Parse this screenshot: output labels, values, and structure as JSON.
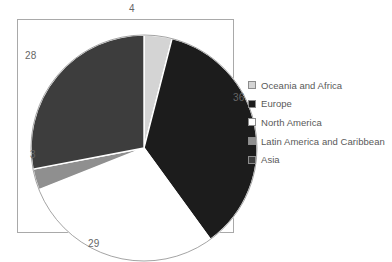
{
  "chart_data": {
    "type": "pie",
    "title": "",
    "subtitle": "",
    "xlabel": "",
    "ylabel": "",
    "grid": false,
    "legend_position": "right",
    "start_angle_deg": 0,
    "direction": "clockwise",
    "categories": [
      "Oceania and Africa",
      "Europe",
      "North America",
      "Latin America and Caribbean",
      "Asia"
    ],
    "values": [
      4,
      36,
      29,
      3,
      28
    ],
    "value_labels": [
      "4",
      "36",
      "29",
      "3",
      "28"
    ],
    "colors": [
      "#d4d4d4",
      "#1c1c1c",
      "#ffffff",
      "#8f8f8f",
      "#3d3d3d"
    ],
    "slices": [
      {
        "label": "Oceania and Africa",
        "value": 4,
        "value_label": "4",
        "color": "#d4d4d4",
        "start_deg": 0,
        "end_deg": 14.4
      },
      {
        "label": "Europe",
        "value": 36,
        "value_label": "36",
        "color": "#1c1c1c",
        "start_deg": 14.4,
        "end_deg": 144.0
      },
      {
        "label": "North America",
        "value": 29,
        "value_label": "29",
        "color": "#ffffff",
        "start_deg": 144.0,
        "end_deg": 248.4
      },
      {
        "label": "Latin America and Caribbean",
        "value": 3,
        "value_label": "3",
        "color": "#8f8f8f",
        "start_deg": 248.4,
        "end_deg": 259.2
      },
      {
        "label": "Asia",
        "value": 28,
        "value_label": "28",
        "color": "#3d3d3d",
        "start_deg": 259.2,
        "end_deg": 360.0
      }
    ]
  },
  "legend": {
    "items": [
      {
        "label": "Oceania and Africa",
        "color": "#d4d4d4"
      },
      {
        "label": "Europe",
        "color": "#1c1c1c"
      },
      {
        "label": "North America",
        "color": "#ffffff"
      },
      {
        "label": "Latin America and Caribbean",
        "color": "#8f8f8f"
      },
      {
        "label": "Asia",
        "color": "#3d3d3d"
      }
    ]
  },
  "plot": {
    "border_color": "#a9a9a9",
    "background": "#ffffff"
  }
}
